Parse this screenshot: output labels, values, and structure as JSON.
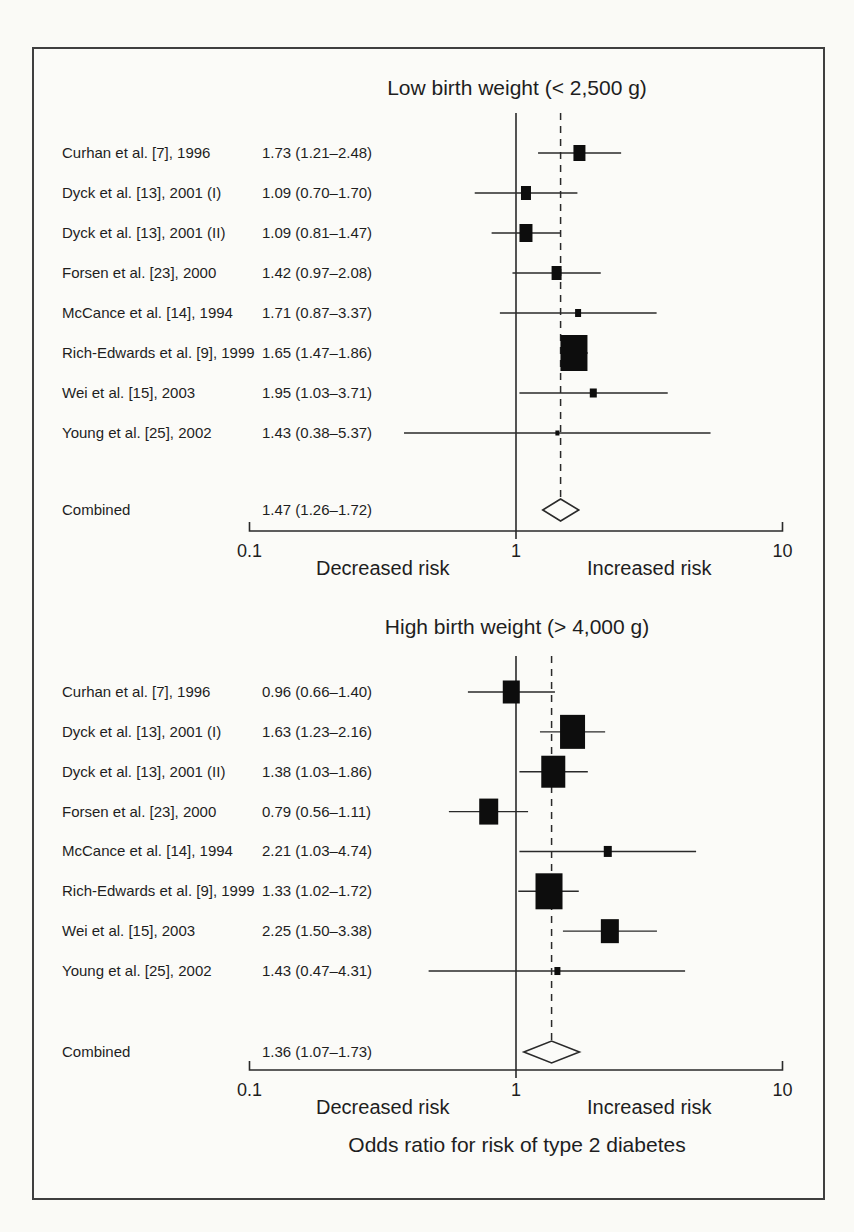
{
  "figure": {
    "kind": "forest plot meta-analysis",
    "x_axis_title": "Odds ratio for risk of type 2 diabetes",
    "colors": {
      "paper": "#fbfbf8",
      "ink": "#1e1e1e",
      "line": "#2a2a2a",
      "marker": "#0d0d0d",
      "frame": "#3f3f3f"
    }
  },
  "chart_data": [
    {
      "type": "forest",
      "title": "Low birth weight (< 2,500 g)",
      "x_axis": {
        "scale": "log",
        "range": [
          0.1,
          10
        ],
        "ticks": [
          "0.1",
          "1",
          "10"
        ],
        "tick_values": [
          0.1,
          1,
          10
        ],
        "reference_line": 1,
        "pooled_dashed_line": 1.47,
        "left_region_label": "Decreased risk",
        "right_region_label": "Increased risk"
      },
      "studies": [
        {
          "label": "Curhan et al. [7], 1996",
          "estimate_label": "1.73 (1.21–2.48)",
          "or": 1.73,
          "ci_low": 1.21,
          "ci_high": 2.48,
          "marker_size": 12
        },
        {
          "label": "Dyck et al. [13], 2001 (I)",
          "estimate_label": "1.09 (0.70–1.70)",
          "or": 1.09,
          "ci_low": 0.7,
          "ci_high": 1.7,
          "marker_size": 10
        },
        {
          "label": "Dyck et al. [13], 2001 (II)",
          "estimate_label": "1.09 (0.81–1.47)",
          "or": 1.09,
          "ci_low": 0.81,
          "ci_high": 1.47,
          "marker_size": 13
        },
        {
          "label": "Forsen et al. [23], 2000",
          "estimate_label": "1.42 (0.97–2.08)",
          "or": 1.42,
          "ci_low": 0.97,
          "ci_high": 2.08,
          "marker_size": 10
        },
        {
          "label": "McCance et al. [14], 1994",
          "estimate_label": "1.71 (0.87–3.37)",
          "or": 1.71,
          "ci_low": 0.87,
          "ci_high": 3.37,
          "marker_size": 6
        },
        {
          "label": "Rich-Edwards et al. [9], 1999",
          "estimate_label": "1.65 (1.47–1.86)",
          "or": 1.65,
          "ci_low": 1.47,
          "ci_high": 1.86,
          "marker_size": 27
        },
        {
          "label": "Wei et al. [15], 2003",
          "estimate_label": "1.95 (1.03–3.71)",
          "or": 1.95,
          "ci_low": 1.03,
          "ci_high": 3.71,
          "marker_size": 7
        },
        {
          "label": "Young et al. [25], 2002",
          "estimate_label": "1.43 (0.38–5.37)",
          "or": 1.43,
          "ci_low": 0.38,
          "ci_high": 5.37,
          "marker_size": 4
        }
      ],
      "combined": {
        "label": "Combined",
        "estimate_label": "1.47 (1.26–1.72)",
        "or": 1.47,
        "ci_low": 1.26,
        "ci_high": 1.72
      }
    },
    {
      "type": "forest",
      "title": "High birth weight (> 4,000 g)",
      "xlabel": "Odds ratio for risk of type 2 diabetes",
      "x_axis": {
        "scale": "log",
        "range": [
          0.1,
          10
        ],
        "ticks": [
          "0.1",
          "1",
          "10"
        ],
        "tick_values": [
          0.1,
          1,
          10
        ],
        "reference_line": 1,
        "pooled_dashed_line": 1.36,
        "left_region_label": "Decreased risk",
        "right_region_label": "Increased risk"
      },
      "studies": [
        {
          "label": "Curhan et al. [7], 1996",
          "estimate_label": "0.96 (0.66–1.40)",
          "or": 0.96,
          "ci_low": 0.66,
          "ci_high": 1.4,
          "marker_size": 17
        },
        {
          "label": "Dyck et al. [13], 2001 (I)",
          "estimate_label": "1.63 (1.23–2.16)",
          "or": 1.63,
          "ci_low": 1.23,
          "ci_high": 2.16,
          "marker_size": 25
        },
        {
          "label": "Dyck et al. [13], 2001 (II)",
          "estimate_label": "1.38 (1.03–1.86)",
          "or": 1.38,
          "ci_low": 1.03,
          "ci_high": 1.86,
          "marker_size": 24
        },
        {
          "label": "Forsen et al. [23], 2000",
          "estimate_label": "0.79 (0.56–1.11)",
          "or": 0.79,
          "ci_low": 0.56,
          "ci_high": 1.11,
          "marker_size": 19
        },
        {
          "label": "McCance et al. [14], 1994",
          "estimate_label": "2.21 (1.03–4.74)",
          "or": 2.21,
          "ci_low": 1.03,
          "ci_high": 4.74,
          "marker_size": 8
        },
        {
          "label": "Rich-Edwards et al. [9], 1999",
          "estimate_label": "1.33 (1.02–1.72)",
          "or": 1.33,
          "ci_low": 1.02,
          "ci_high": 1.72,
          "marker_size": 27
        },
        {
          "label": "Wei et al. [15], 2003",
          "estimate_label": "2.25 (1.50–3.38)",
          "or": 2.25,
          "ci_low": 1.5,
          "ci_high": 3.38,
          "marker_size": 18
        },
        {
          "label": "Young et al. [25], 2002",
          "estimate_label": "1.43 (0.47–4.31)",
          "or": 1.43,
          "ci_low": 0.47,
          "ci_high": 4.31,
          "marker_size": 6
        }
      ],
      "combined": {
        "label": "Combined",
        "estimate_label": "1.36 (1.07–1.73)",
        "or": 1.36,
        "ci_low": 1.07,
        "ci_high": 1.73
      }
    }
  ]
}
